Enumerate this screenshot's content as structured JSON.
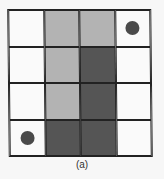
{
  "figure": {
    "caption": "(a)",
    "rows": 4,
    "cols": 4,
    "colors": {
      "white": "#fafafa",
      "light": "#b3b3b3",
      "dark": "#555555",
      "dot": "#4a4a4a",
      "line": "#222222"
    },
    "cells": [
      [
        "white",
        "light",
        "light",
        "white"
      ],
      [
        "white",
        "light",
        "dark",
        "white"
      ],
      [
        "white",
        "light",
        "dark",
        "white"
      ],
      [
        "white",
        "dark",
        "dark",
        "white"
      ]
    ],
    "markers": [
      {
        "row": 0,
        "col": 3,
        "shape": "circle"
      },
      {
        "row": 3,
        "col": 0,
        "shape": "circle"
      }
    ]
  }
}
